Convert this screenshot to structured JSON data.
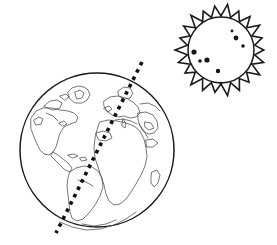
{
  "figure": {
    "background_color": "#ffffff",
    "line_color": "#1a1a1a",
    "coastline_color": "#4a4a4a",
    "axis_color": "#111111",
    "sunspot_color": "#161616",
    "width": 277,
    "height": 245
  },
  "earth": {
    "label": "earth-globe",
    "center_x": 97,
    "center_y": 150,
    "radius": 77,
    "continents": [
      "north-america",
      "central-america",
      "south-america",
      "greenland",
      "europe",
      "africa",
      "middle-east",
      "madagascar",
      "antarctica-edge"
    ]
  },
  "axis": {
    "label": "rotation-axis",
    "style": "dotted",
    "top_x": 142,
    "top_y": 62,
    "bottom_x": 56,
    "bottom_y": 233,
    "dot_size": 3.6
  },
  "sun": {
    "label": "sun",
    "center_x": 221,
    "center_y": 50,
    "disc_radius": 33,
    "corona_outer_radius": 46,
    "corona_points": 22,
    "sunspots": [
      {
        "x": 232,
        "y": 31,
        "r": 1.4
      },
      {
        "x": 243,
        "y": 46,
        "r": 1.8
      },
      {
        "x": 236,
        "y": 38,
        "r": 2.4
      },
      {
        "x": 194,
        "y": 52,
        "r": 2.6
      },
      {
        "x": 207,
        "y": 60,
        "r": 2.6
      },
      {
        "x": 200,
        "y": 61,
        "r": 1.8
      },
      {
        "x": 218,
        "y": 71,
        "r": 2.2
      },
      {
        "x": 221,
        "y": 83,
        "r": 1.3
      }
    ]
  }
}
